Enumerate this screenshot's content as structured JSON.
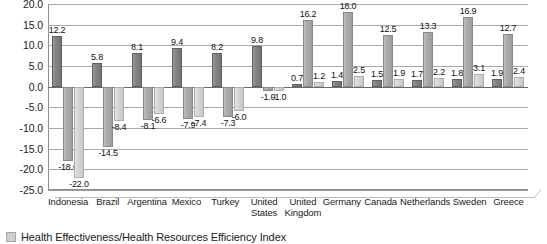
{
  "chart_data": {
    "type": "bar",
    "title": "",
    "subtitle": "",
    "xlabel": "",
    "ylabel": "",
    "ylim": [
      -25.0,
      20.0
    ],
    "ytick_step": 5.0,
    "yticks": [
      "20.0",
      "15.0",
      "10.0",
      "5.0",
      "0.0",
      "-5.0",
      "-10.0",
      "-15.0",
      "-20.0",
      "-25.0"
    ],
    "ytick_values": [
      20.0,
      15.0,
      10.0,
      5.0,
      0.0,
      -5.0,
      -10.0,
      -15.0,
      -20.0,
      -25.0
    ],
    "grid": true,
    "legend_position": "bottom-left",
    "categories": [
      "Indonesia",
      "Brazil",
      "Argentina",
      "Mexico",
      "Turkey",
      "United States",
      "United Kingdom",
      "Germany",
      "Canada",
      "Netherlands",
      "Sweden",
      "Greece"
    ],
    "series": [
      {
        "name": "Health Effectiveness/Health Resources Efficiency Index",
        "color": "#7d7d7d",
        "values": [
          12.2,
          5.8,
          8.1,
          9.4,
          8.2,
          9.8,
          0.7,
          1.4,
          1.5,
          1.7,
          1.8,
          1.9
        ],
        "labels": [
          "12.2",
          "5.8",
          "8.1",
          "9.4",
          "8.2",
          "9.8",
          "0.7",
          "1.4",
          "1.5",
          "1.7",
          "1.8",
          "1.9"
        ]
      },
      {
        "name": "series-2",
        "color": "#a8a8a8",
        "values": [
          -18.0,
          -14.5,
          -8.1,
          -7.9,
          -7.3,
          -1.0,
          16.2,
          18.0,
          12.5,
          13.3,
          16.9,
          12.7
        ],
        "labels": [
          "-18.0",
          "-14.5",
          "-8.1",
          "-7.9",
          "-7.3",
          "-1.0",
          "16.2",
          "18.0",
          "12.5",
          "13.3",
          "16.9",
          "12.7"
        ]
      },
      {
        "name": "series-3",
        "color": "#d6d6d6",
        "values": [
          -22.0,
          -8.4,
          -6.6,
          -7.4,
          -6.0,
          -1.0,
          1.2,
          2.5,
          1.9,
          2.2,
          3.1,
          2.4
        ],
        "labels": [
          "-22.0",
          "-8.4",
          "-6.6",
          "-7.4",
          "-6.0",
          "-1.0",
          "1.2",
          "2.5",
          "1.9",
          "2.2",
          "3.1",
          "2.4"
        ]
      }
    ]
  },
  "legend": {
    "items": [
      {
        "label": "Health Effectiveness/Health Resources Efficiency Index",
        "swatch": "#cfcfcf"
      }
    ]
  }
}
